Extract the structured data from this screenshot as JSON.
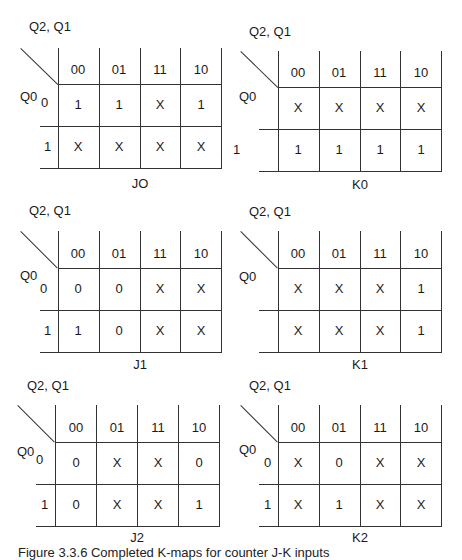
{
  "column_variables": "Q2, Q1",
  "row_variable": "Q0",
  "column_headers": [
    "00",
    "01",
    "11",
    "10"
  ],
  "row_headers": [
    "0",
    "1"
  ],
  "maps": [
    {
      "name": "JO",
      "rows": [
        [
          "1",
          "1",
          "X",
          "1"
        ],
        [
          "X",
          "X",
          "X",
          "X"
        ]
      ]
    },
    {
      "name": "K0",
      "rows": [
        [
          "X",
          "X",
          "X",
          "X"
        ],
        [
          "1",
          "1",
          "1",
          "1"
        ]
      ]
    },
    {
      "name": "J1",
      "rows": [
        [
          "0",
          "0",
          "X",
          "X"
        ],
        [
          "1",
          "0",
          "X",
          "X"
        ]
      ]
    },
    {
      "name": "K1",
      "rows": [
        [
          "X",
          "X",
          "X",
          "1"
        ],
        [
          "X",
          "X",
          "X",
          "1"
        ]
      ]
    },
    {
      "name": "J2",
      "rows": [
        [
          "0",
          "X",
          "X",
          "0"
        ],
        [
          "0",
          "X",
          "X",
          "1"
        ]
      ]
    },
    {
      "name": "K2",
      "rows": [
        [
          "X",
          "0",
          "X",
          "X"
        ],
        [
          "X",
          "1",
          "X",
          "X"
        ]
      ]
    }
  ],
  "visible_row_labels": {
    "JO": [
      "0",
      "1"
    ],
    "K0": [
      "",
      "1"
    ],
    "J1": [
      "0",
      "1"
    ],
    "K1": [
      "",
      ""
    ],
    "J2": [
      "0",
      "1"
    ],
    "K2": [
      "0",
      "1"
    ]
  },
  "caption": "Figure 3.3.6 Completed K-maps for counter J-K inputs"
}
